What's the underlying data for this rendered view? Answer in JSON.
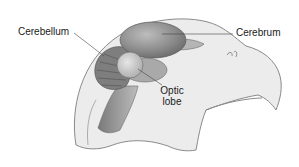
{
  "diagram": {
    "labels": {
      "cerebellum": "Cerebellum",
      "cerebrum": "Cerebrum",
      "optic_lobe_line1": "Optic",
      "optic_lobe_line2": "lobe"
    },
    "colors": {
      "head_fill": "#ececec",
      "head_outline": "#8a8a8a",
      "cerebrum_fill": "#8c8c8c",
      "cerebellum_fill": "#7a7a7a",
      "optic_lobe_fill": "#c8c8c8",
      "brainstem_fill": "#9a9a9a",
      "leader_line": "#444444",
      "text": "#1a1a1a"
    }
  }
}
